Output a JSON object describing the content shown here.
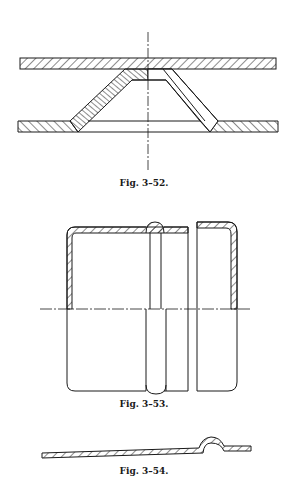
{
  "figures": [
    {
      "id": "fig-3-52",
      "caption": "Fig. 3–52."
    },
    {
      "id": "fig-3-53",
      "caption": "Fig. 3–53."
    },
    {
      "id": "fig-3-54",
      "caption": "Fig. 3–54."
    }
  ],
  "colors": {
    "ink": "#1a1a1a",
    "paper": "#ffffff"
  }
}
